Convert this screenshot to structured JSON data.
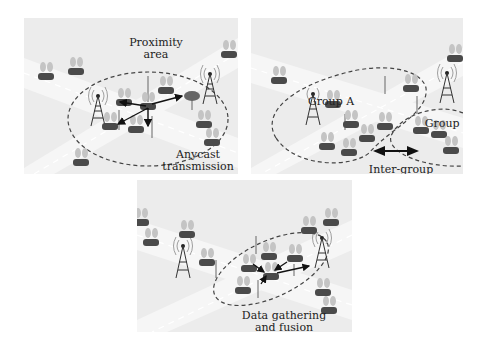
{
  "figure": {
    "panels": [
      {
        "id": "anycast",
        "labels": {
          "area_line1": "Proximity",
          "area_line2": "area",
          "caption_line1": "Anycast",
          "caption_line2": "transmission"
        }
      },
      {
        "id": "intergroup",
        "labels": {
          "group_a": "Group A",
          "group_b": "Group B",
          "caption_line1": "Inter-group",
          "caption_line2": "communication"
        }
      },
      {
        "id": "fusion",
        "labels": {
          "caption_line1": "Data gathering",
          "caption_line2": "and fusion"
        }
      }
    ],
    "colors": {
      "panel_bg": "#ececec",
      "road": "#f6f6f6",
      "vehicle": "#4a4a4a",
      "antenna": "#b5b5b5",
      "tower": "#333333",
      "dashed_boundary": "#444444",
      "arrow": "#111111"
    },
    "icons": [
      "vehicle-icon",
      "cell-tower-icon",
      "roadside-unit-icon",
      "tree-icon"
    ]
  }
}
